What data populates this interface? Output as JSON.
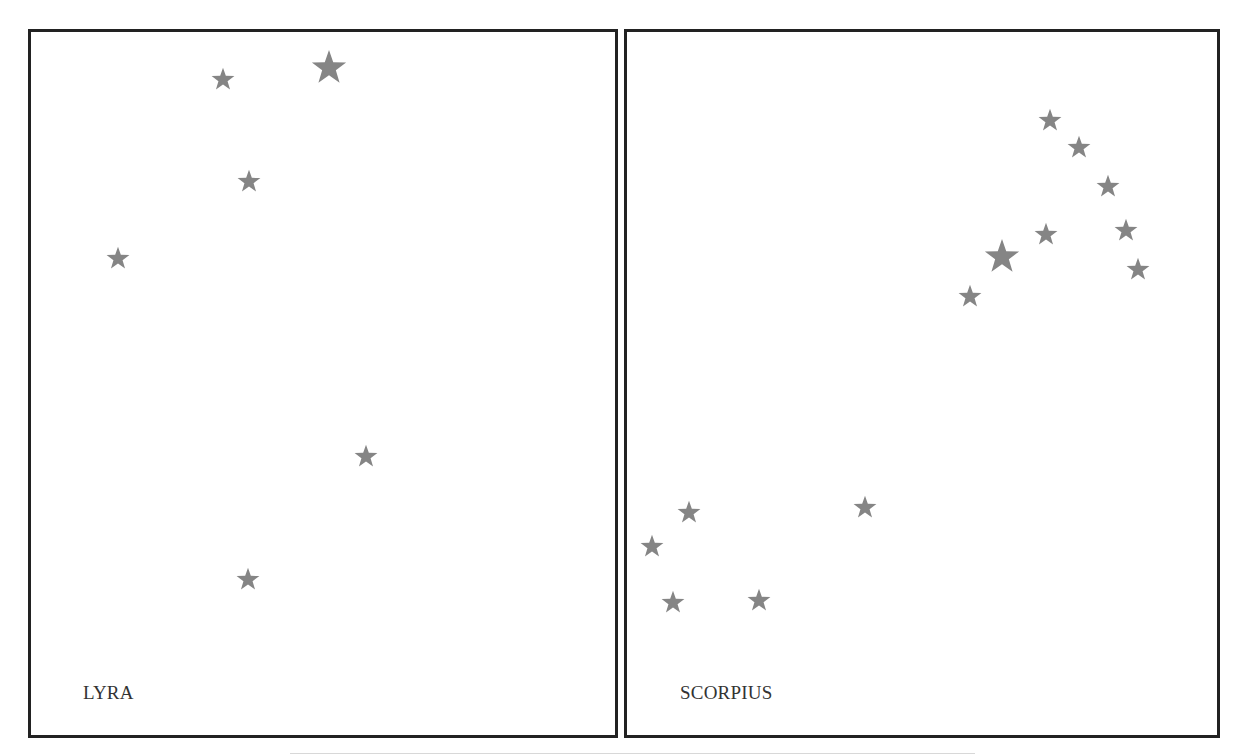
{
  "colors": {
    "star": "#858585",
    "border": "#222222",
    "label": "#333333"
  },
  "panels": [
    {
      "name": "lyra",
      "label": "LYRA",
      "box": {
        "left": 28,
        "top": 29,
        "width": 590,
        "height": 709
      },
      "label_pos": {
        "x": 83,
        "y": 683
      },
      "stars": [
        {
          "x": 223,
          "y": 79,
          "size": 24
        },
        {
          "x": 329,
          "y": 67,
          "size": 36
        },
        {
          "x": 249,
          "y": 181,
          "size": 24
        },
        {
          "x": 118,
          "y": 258,
          "size": 24
        },
        {
          "x": 366,
          "y": 456,
          "size": 24
        },
        {
          "x": 248,
          "y": 579,
          "size": 24
        }
      ]
    },
    {
      "name": "scorpius",
      "label": "SCORPIUS",
      "box": {
        "left": 624,
        "top": 29,
        "width": 596,
        "height": 709
      },
      "label_pos": {
        "x": 680,
        "y": 683
      },
      "stars": [
        {
          "x": 1050,
          "y": 120,
          "size": 24
        },
        {
          "x": 1079,
          "y": 147,
          "size": 24
        },
        {
          "x": 1108,
          "y": 186,
          "size": 24
        },
        {
          "x": 1046,
          "y": 234,
          "size": 24
        },
        {
          "x": 1126,
          "y": 230,
          "size": 24
        },
        {
          "x": 1002,
          "y": 256,
          "size": 36
        },
        {
          "x": 1138,
          "y": 269,
          "size": 24
        },
        {
          "x": 970,
          "y": 296,
          "size": 24
        },
        {
          "x": 689,
          "y": 512,
          "size": 24
        },
        {
          "x": 652,
          "y": 546,
          "size": 24
        },
        {
          "x": 673,
          "y": 602,
          "size": 24
        },
        {
          "x": 759,
          "y": 600,
          "size": 24
        },
        {
          "x": 865,
          "y": 507,
          "size": 24
        }
      ]
    }
  ],
  "bottom_rule": {
    "left": 290,
    "top": 753,
    "width": 685
  }
}
